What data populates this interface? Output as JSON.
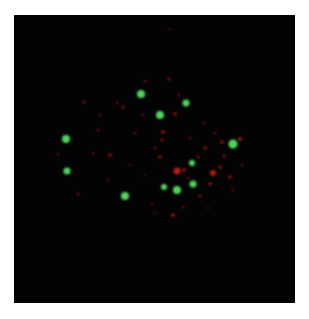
{
  "image": {
    "description": "Fluorescence microscopy image of a cell nucleus with green and red puncta on black background",
    "background_color": "#030303",
    "frame": {
      "x": 14,
      "y": 15,
      "width": 281,
      "height": 288
    }
  },
  "colors": {
    "green": "#4fd65a",
    "red": "#c0201c",
    "red_dim": "#6e1212"
  },
  "green_spots": [
    {
      "x": 141,
      "y": 94,
      "r": 4
    },
    {
      "x": 186,
      "y": 103,
      "r": 3.5
    },
    {
      "x": 160,
      "y": 115,
      "r": 4
    },
    {
      "x": 66,
      "y": 139,
      "r": 4
    },
    {
      "x": 233,
      "y": 144,
      "r": 4.5
    },
    {
      "x": 67,
      "y": 171,
      "r": 3.5
    },
    {
      "x": 192,
      "y": 163,
      "r": 3
    },
    {
      "x": 164,
      "y": 187,
      "r": 3
    },
    {
      "x": 177,
      "y": 190,
      "r": 4
    },
    {
      "x": 193,
      "y": 184,
      "r": 3.5
    },
    {
      "x": 125,
      "y": 196,
      "r": 4
    }
  ],
  "red_spots": [
    {
      "x": 177,
      "y": 171,
      "r": 3.5,
      "o": 0.95
    },
    {
      "x": 213,
      "y": 173,
      "r": 3,
      "o": 0.9
    },
    {
      "x": 240,
      "y": 139,
      "r": 2,
      "o": 0.8
    },
    {
      "x": 163,
      "y": 132,
      "r": 2,
      "o": 0.7
    },
    {
      "x": 160,
      "y": 157,
      "r": 2,
      "o": 0.6
    },
    {
      "x": 184,
      "y": 170,
      "r": 2,
      "o": 0.7
    },
    {
      "x": 123,
      "y": 107,
      "r": 1.8,
      "o": 0.6
    },
    {
      "x": 84,
      "y": 102,
      "r": 1.8,
      "o": 0.5
    },
    {
      "x": 117,
      "y": 103,
      "r": 1.5,
      "o": 0.5
    },
    {
      "x": 110,
      "y": 155,
      "r": 2,
      "o": 0.6
    },
    {
      "x": 173,
      "y": 215,
      "r": 2,
      "o": 0.75
    },
    {
      "x": 78,
      "y": 194,
      "r": 1.5,
      "o": 0.5
    },
    {
      "x": 179,
      "y": 95,
      "r": 1.5,
      "o": 0.5
    },
    {
      "x": 145,
      "y": 81,
      "r": 1.5,
      "o": 0.5
    },
    {
      "x": 169,
      "y": 79,
      "r": 1.8,
      "o": 0.55
    },
    {
      "x": 175,
      "y": 114,
      "r": 2,
      "o": 0.65
    },
    {
      "x": 205,
      "y": 148,
      "r": 2,
      "o": 0.6
    },
    {
      "x": 222,
      "y": 142,
      "r": 2,
      "o": 0.65
    },
    {
      "x": 220,
      "y": 167,
      "r": 2,
      "o": 0.6
    },
    {
      "x": 224,
      "y": 156,
      "r": 1.8,
      "o": 0.55
    },
    {
      "x": 210,
      "y": 184,
      "r": 2,
      "o": 0.6
    },
    {
      "x": 230,
      "y": 177,
      "r": 2,
      "o": 0.6
    },
    {
      "x": 200,
      "y": 196,
      "r": 1.8,
      "o": 0.5
    },
    {
      "x": 152,
      "y": 204,
      "r": 1.5,
      "o": 0.45
    },
    {
      "x": 162,
      "y": 140,
      "r": 1.8,
      "o": 0.55
    },
    {
      "x": 155,
      "y": 148,
      "r": 1.5,
      "o": 0.5
    },
    {
      "x": 143,
      "y": 115,
      "r": 1.5,
      "o": 0.45
    },
    {
      "x": 98,
      "y": 130,
      "r": 1.5,
      "o": 0.45
    },
    {
      "x": 93,
      "y": 153,
      "r": 1.5,
      "o": 0.45
    },
    {
      "x": 108,
      "y": 180,
      "r": 1.5,
      "o": 0.4
    },
    {
      "x": 183,
      "y": 207,
      "r": 1.5,
      "o": 0.45
    },
    {
      "x": 198,
      "y": 157,
      "r": 1.8,
      "o": 0.55
    },
    {
      "x": 204,
      "y": 123,
      "r": 1.5,
      "o": 0.45
    },
    {
      "x": 190,
      "y": 138,
      "r": 1.5,
      "o": 0.45
    },
    {
      "x": 135,
      "y": 133,
      "r": 1.5,
      "o": 0.45
    },
    {
      "x": 58,
      "y": 154,
      "r": 1.5,
      "o": 0.4
    },
    {
      "x": 233,
      "y": 190,
      "r": 1.5,
      "o": 0.4
    },
    {
      "x": 242,
      "y": 165,
      "r": 1.5,
      "o": 0.4
    },
    {
      "x": 130,
      "y": 165,
      "r": 1.3,
      "o": 0.35
    },
    {
      "x": 145,
      "y": 175,
      "r": 1.3,
      "o": 0.35
    },
    {
      "x": 155,
      "y": 213,
      "r": 1.3,
      "o": 0.4
    },
    {
      "x": 208,
      "y": 208,
      "r": 1.3,
      "o": 0.4
    },
    {
      "x": 170,
      "y": 29,
      "r": 1.2,
      "o": 0.4
    },
    {
      "x": 100,
      "y": 115,
      "r": 1.3,
      "o": 0.4
    },
    {
      "x": 215,
      "y": 133,
      "r": 1.5,
      "o": 0.5
    },
    {
      "x": 188,
      "y": 178,
      "r": 1.5,
      "o": 0.5
    }
  ]
}
